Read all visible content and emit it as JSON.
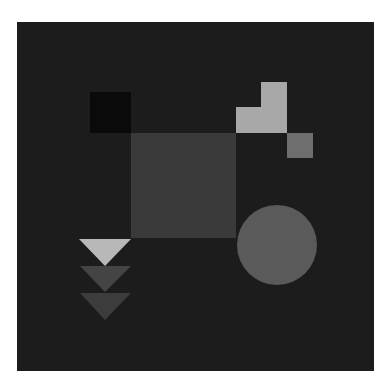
{
  "canvas": {
    "background_color": "#ffffff",
    "panel_color": "#1c1c1c"
  },
  "shapes": [
    {
      "id": "black-square",
      "kind": "square",
      "color": "#0a0a0a"
    },
    {
      "id": "center-square",
      "kind": "square",
      "color": "#3a3a3a"
    },
    {
      "id": "l-block-top",
      "kind": "square",
      "color": "#a8a8a8"
    },
    {
      "id": "l-block-bar",
      "kind": "rect",
      "color": "#a8a8a8"
    },
    {
      "id": "small-square",
      "kind": "square",
      "color": "#6e6e6e"
    },
    {
      "id": "circle",
      "kind": "circle",
      "color": "#5a5a5a"
    },
    {
      "id": "triangle-light",
      "kind": "triangle-down",
      "color": "#b8b8b8"
    },
    {
      "id": "triangle-mid",
      "kind": "triangle-down",
      "color": "#444444"
    },
    {
      "id": "triangle-bottom",
      "kind": "triangle-down",
      "color": "#3c3c3c"
    }
  ]
}
